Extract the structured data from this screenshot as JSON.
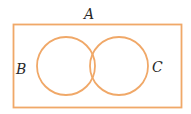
{
  "diagram": {
    "type": "venn",
    "universe_label": "A",
    "sets": [
      {
        "label": "B",
        "position": "left"
      },
      {
        "label": "C",
        "position": "right"
      }
    ],
    "colors": {
      "stroke": "#f0a868",
      "text": "#2a2a2a",
      "background": "#ffffff"
    }
  }
}
